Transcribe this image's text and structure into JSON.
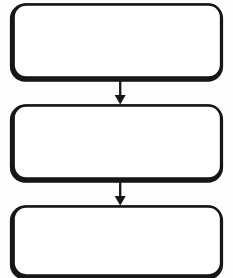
{
  "diagram": {
    "type": "flowchart",
    "orientation": "vertical",
    "canvas": {
      "width": 233,
      "height": 278,
      "background": "#fdfdfc"
    },
    "style": {
      "stroke_color": "#111111",
      "fill_color": "#ffffff",
      "corner_radius": 13,
      "border_width_top": 2.4,
      "border_width_left": 4.0,
      "border_width_bottom": 3.6,
      "border_width_right": 2.4,
      "arrow_color": "#111111"
    },
    "nodes": [
      {
        "id": "box-1",
        "shape": "rounded-rectangle",
        "label": "",
        "x": 13,
        "y": 4,
        "width": 209,
        "height": 74
      },
      {
        "id": "box-2",
        "shape": "rounded-rectangle",
        "label": "",
        "x": 13,
        "y": 105,
        "width": 209,
        "height": 74
      },
      {
        "id": "box-3",
        "shape": "rounded-rectangle",
        "label": "",
        "x": 13,
        "y": 206,
        "width": 209,
        "height": 70
      }
    ],
    "connectors": [
      {
        "id": "arrow-1",
        "from": "box-1",
        "to": "box-2",
        "label": "",
        "x": 120,
        "y_start": 78,
        "y_end": 104,
        "head": "triangle-down",
        "head_width": 11,
        "head_height": 10,
        "shaft_width": 2.2
      },
      {
        "id": "arrow-2",
        "from": "box-2",
        "to": "box-3",
        "label": "",
        "x": 120,
        "y_start": 179,
        "y_end": 205,
        "head": "triangle-down",
        "head_width": 11,
        "head_height": 10,
        "shaft_width": 2.2
      }
    ]
  }
}
